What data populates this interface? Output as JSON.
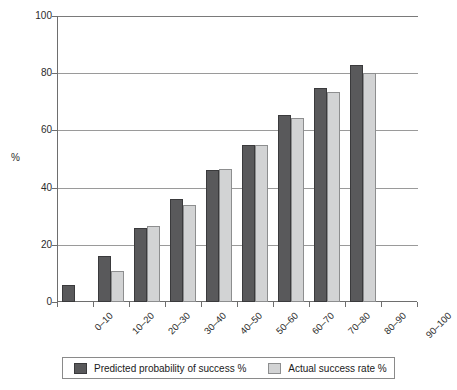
{
  "chart_data": {
    "type": "bar",
    "title": "",
    "xlabel": "",
    "ylabel": "%",
    "ylim": [
      0,
      100
    ],
    "yticks": [
      0,
      20,
      40,
      60,
      80,
      100
    ],
    "grid": true,
    "legend_position": "bottom",
    "categories": [
      "0–10",
      "10–20",
      "20–30",
      "30–40",
      "40–50",
      "50–60",
      "60–70",
      "70–80",
      "80–90",
      "90–100"
    ],
    "series": [
      {
        "name": "Predicted probability of success %",
        "color": "#59595b",
        "values": [
          6,
          16,
          26,
          36,
          46,
          55,
          65.5,
          75,
          83,
          null
        ]
      },
      {
        "name": "Actual success rate %",
        "color": "#d2d3d4",
        "values": [
          null,
          11,
          26.5,
          34,
          46.5,
          55,
          64.5,
          73.5,
          80,
          null
        ]
      }
    ]
  },
  "legend": {
    "entries": [
      {
        "label": "Predicted probability of success %",
        "swatch": "predicted-swatch"
      },
      {
        "label": "Actual success rate %",
        "swatch": "actual-swatch"
      }
    ]
  },
  "axes": {
    "y_title": "%",
    "y_tick_labels": [
      "100",
      "80",
      "60",
      "40",
      "20",
      "0"
    ],
    "x_tick_labels": [
      "0–10",
      "10–20",
      "20–30",
      "30–40",
      "40–50",
      "50–60",
      "60–70",
      "70–80",
      "80–90",
      "90–100"
    ]
  }
}
